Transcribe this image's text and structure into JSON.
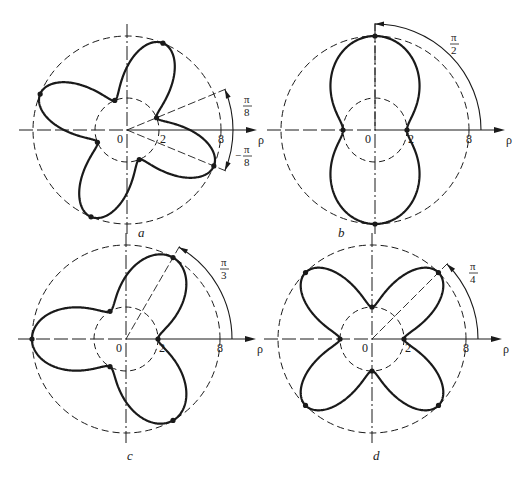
{
  "figure": {
    "axis_label": "ρ",
    "origin_label": "0",
    "inner_label": "2",
    "outer_label": "8",
    "ink_color": "#1a1a1a",
    "background": "#ffffff"
  },
  "panels": [
    {
      "id": "a",
      "caption": "a",
      "center": [
        127,
        130
      ],
      "func": "sin",
      "k": 4,
      "sign": -1,
      "angle_labels": [
        {
          "num": "π",
          "den": "8",
          "sign": ""
        },
        {
          "num": "π",
          "den": "8",
          "sign": "−"
        }
      ],
      "arc_angles_deg": [
        22.5,
        -22.5
      ]
    },
    {
      "id": "b",
      "caption": "b",
      "center": [
        375,
        130
      ],
      "func": "cos",
      "k": 2,
      "sign": -1,
      "angle_labels": [
        {
          "num": "π",
          "den": "2",
          "sign": ""
        }
      ],
      "arc_angles_deg": [
        90
      ]
    },
    {
      "id": "c",
      "caption": "c",
      "center": [
        126,
        339
      ],
      "func": "cos",
      "k": 3,
      "sign": -1,
      "angle_labels": [
        {
          "num": "π",
          "den": "3",
          "sign": ""
        }
      ],
      "arc_angles_deg": [
        60
      ]
    },
    {
      "id": "d",
      "caption": "d",
      "center": [
        372,
        339
      ],
      "func": "cos",
      "k": 4,
      "sign": -1,
      "angle_labels": [
        {
          "num": "π",
          "den": "4",
          "sign": ""
        }
      ],
      "arc_angles_deg": [
        45
      ]
    }
  ]
}
